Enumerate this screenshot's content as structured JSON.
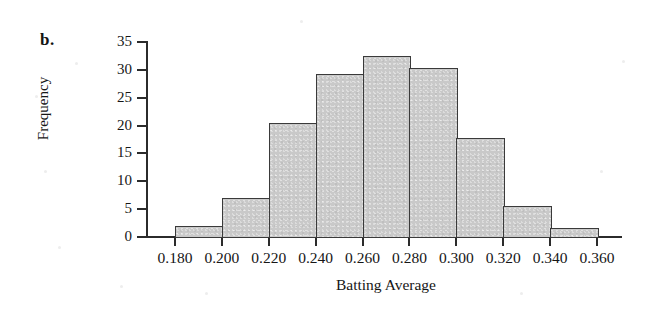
{
  "figure": {
    "panel_label": "b."
  },
  "chart_data": {
    "type": "bar",
    "title": "",
    "xlabel": "Batting Average",
    "ylabel": "Frequency",
    "grid": false,
    "legend": false,
    "bin_width": 0.02,
    "bin_edges": [
      0.18,
      0.2,
      0.22,
      0.24,
      0.26,
      0.28,
      0.3,
      0.32,
      0.34,
      0.36
    ],
    "categories": [
      "0.180-0.200",
      "0.200-0.220",
      "0.220-0.240",
      "0.240-0.260",
      "0.260-0.280",
      "0.280-0.300",
      "0.300-0.320",
      "0.320-0.340",
      "0.340-0.360"
    ],
    "values": [
      2,
      7,
      20.5,
      29.3,
      32.5,
      30.3,
      17.7,
      5.5,
      1.6
    ],
    "xlim": [
      0.18,
      0.36
    ],
    "ylim": [
      0,
      35
    ],
    "xticks": [
      0.18,
      0.2,
      0.22,
      0.24,
      0.26,
      0.28,
      0.3,
      0.32,
      0.34,
      0.36
    ],
    "xtick_labels": [
      "0.180",
      "0.200",
      "0.220",
      "0.240",
      "0.260",
      "0.280",
      "0.300",
      "0.320",
      "0.340",
      "0.360"
    ],
    "yticks": [
      0,
      5,
      10,
      15,
      20,
      25,
      30,
      35
    ],
    "ytick_labels": [
      "0",
      "5",
      "10",
      "15",
      "20",
      "25",
      "30",
      "35"
    ],
    "bar_fill_color": "#c9c9c9",
    "bar_edge_color": "#3a3a3a",
    "axis_color": "#2b2b2b"
  }
}
